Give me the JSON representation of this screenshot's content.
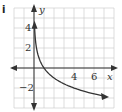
{
  "part_label": "i",
  "chart_data": {
    "type": "line",
    "title": "",
    "function": "y = log_{1/2}(x)",
    "xlabel": "x",
    "ylabel": "y",
    "x_ticks": [
      {
        "value": 4,
        "label": "4"
      },
      {
        "value": 6,
        "label": "6"
      }
    ],
    "y_ticks": [
      {
        "value": 4,
        "label": "4"
      },
      {
        "value": 2,
        "label": "2"
      },
      {
        "value": -2,
        "label": "−2"
      }
    ],
    "xlim": [
      -2,
      8
    ],
    "ylim": [
      -4,
      6
    ],
    "grid": true,
    "series": [
      {
        "name": "curve",
        "x": [
          0.05,
          0.125,
          0.25,
          0.5,
          1,
          2,
          4,
          7
        ],
        "values": [
          4.3,
          3,
          2,
          1,
          0,
          -1,
          -2,
          -2.8
        ]
      }
    ]
  },
  "colors": {
    "grid": "#c8c8c8",
    "axis": "#333333",
    "curve": "#333333"
  }
}
